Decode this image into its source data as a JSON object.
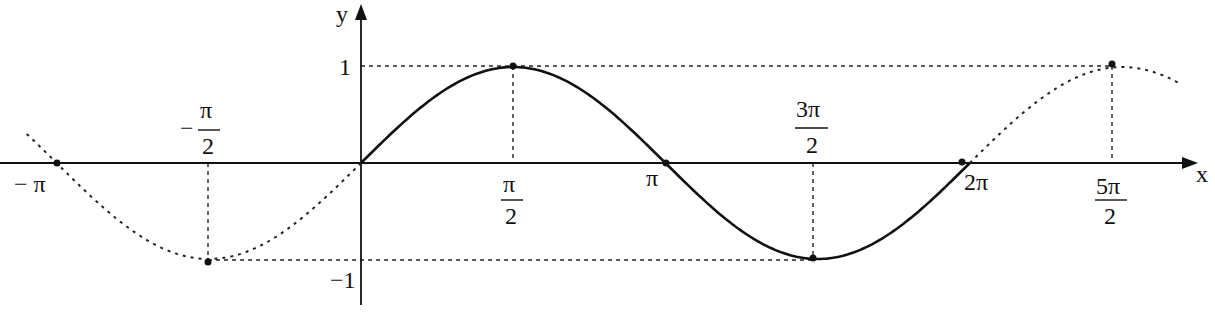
{
  "chart_data": {
    "type": "line",
    "title": "",
    "function": "y = sin(x)",
    "xlabel": "x",
    "ylabel": "y",
    "xlim": [
      -3.4,
      3.0
    ],
    "ylim": [
      -1.45,
      1.65
    ],
    "series": [
      {
        "name": "sin(x) on [0, 2π]",
        "style": "solid",
        "x_range": [
          0,
          6.2832
        ]
      },
      {
        "name": "sin(x) extension left",
        "style": "dotted",
        "x_range": [
          -3.45,
          0
        ]
      },
      {
        "name": "sin(x) extension right",
        "style": "dotted",
        "x_range": [
          6.2832,
          8.45
        ]
      }
    ],
    "x_ticks": [
      {
        "value": -3.1416,
        "label_num": "− π",
        "label_den": ""
      },
      {
        "value": -1.5708,
        "label_num": "π",
        "label_den": "2",
        "sign": "−"
      },
      {
        "value": 1.5708,
        "label_num": "π",
        "label_den": "2"
      },
      {
        "value": 3.1416,
        "label_num": "π",
        "label_den": ""
      },
      {
        "value": 4.7124,
        "label_num": "3π",
        "label_den": "2"
      },
      {
        "value": 6.2832,
        "label_num": "2π",
        "label_den": ""
      },
      {
        "value": 7.854,
        "label_num": "5π",
        "label_den": "2"
      }
    ],
    "y_ticks": [
      {
        "value": 1,
        "label": "1"
      },
      {
        "value": -1,
        "label": "−1"
      }
    ],
    "marked_points": [
      {
        "x": -3.1416,
        "y": 0
      },
      {
        "x": -1.5708,
        "y": -1
      },
      {
        "x": 1.5708,
        "y": 1
      },
      {
        "x": 3.1416,
        "y": 0
      },
      {
        "x": 4.7124,
        "y": -1
      },
      {
        "x": 6.2832,
        "y": 0
      },
      {
        "x": 7.854,
        "y": 1
      }
    ],
    "guides": "dotted horizontal lines at y=1 and y=-1, dotted vertical lines from extrema to x-axis",
    "grid": false,
    "legend": "none"
  },
  "labels": {
    "x_axis": "x",
    "y_axis": "y",
    "y_one": "1",
    "y_neg_one": "−1",
    "neg_pi": "− π",
    "neg_half_pi_sign": "−",
    "neg_half_pi_num": "π",
    "neg_half_pi_den": "2",
    "half_pi_num": "π",
    "half_pi_den": "2",
    "pi": "π",
    "three_half_pi_num": "3π",
    "three_half_pi_den": "2",
    "two_pi": "2π",
    "five_half_pi_num": "5π",
    "five_half_pi_den": "2"
  }
}
